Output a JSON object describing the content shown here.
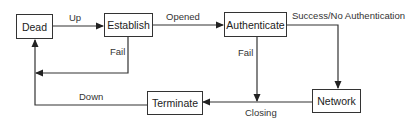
{
  "diagram": {
    "type": "state-machine",
    "states": [
      {
        "id": "dead",
        "label": "Dead"
      },
      {
        "id": "establish",
        "label": "Establish"
      },
      {
        "id": "authenticate",
        "label": "Authenticate"
      },
      {
        "id": "network",
        "label": "Network"
      },
      {
        "id": "terminate",
        "label": "Terminate"
      }
    ],
    "transitions": [
      {
        "from": "dead",
        "to": "establish",
        "label": "Up"
      },
      {
        "from": "establish",
        "to": "authenticate",
        "label": "Opened"
      },
      {
        "from": "establish",
        "to": "dead",
        "label": "Fail"
      },
      {
        "from": "authenticate",
        "to": "network",
        "label": "Success/No Authentication"
      },
      {
        "from": "authenticate",
        "to": "terminate",
        "label": "Fail"
      },
      {
        "from": "network",
        "to": "terminate",
        "label": "Closing"
      },
      {
        "from": "terminate",
        "to": "dead",
        "label": "Down"
      }
    ]
  },
  "colors": {
    "line": "#333333",
    "text": "#222222",
    "background": "#ffffff"
  }
}
